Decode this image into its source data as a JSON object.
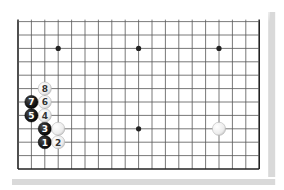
{
  "diagram": {
    "type": "go-board-partial",
    "board_size": 19,
    "visible_rows_from": 7,
    "visible_rows_to": 18,
    "colors": {
      "grid": "#555555",
      "edge": "#222222",
      "black_stone": "#1a1a1a",
      "white_stone": "#f2f2f2",
      "shadow": "#d9d9d9",
      "background": "#ffffff"
    },
    "hoshi": [
      {
        "col": 3,
        "row": 9
      },
      {
        "col": 9,
        "row": 9
      },
      {
        "col": 15,
        "row": 9
      },
      {
        "col": 9,
        "row": 15
      }
    ],
    "stones": [
      {
        "color": "black",
        "col": 2,
        "row": 16,
        "label": "1"
      },
      {
        "color": "white",
        "col": 3,
        "row": 16,
        "label": "2"
      },
      {
        "color": "black",
        "col": 2,
        "row": 15,
        "label": "3"
      },
      {
        "color": "white",
        "col": 2,
        "row": 14,
        "label": "4"
      },
      {
        "color": "black",
        "col": 1,
        "row": 14,
        "label": "5"
      },
      {
        "color": "white",
        "col": 2,
        "row": 13,
        "label": "6"
      },
      {
        "color": "black",
        "col": 1,
        "row": 13,
        "label": "7"
      },
      {
        "color": "white",
        "col": 2,
        "row": 12,
        "label": "8"
      },
      {
        "color": "white",
        "col": 3,
        "row": 15,
        "label": ""
      },
      {
        "color": "white",
        "col": 15,
        "row": 15,
        "label": ""
      }
    ]
  }
}
